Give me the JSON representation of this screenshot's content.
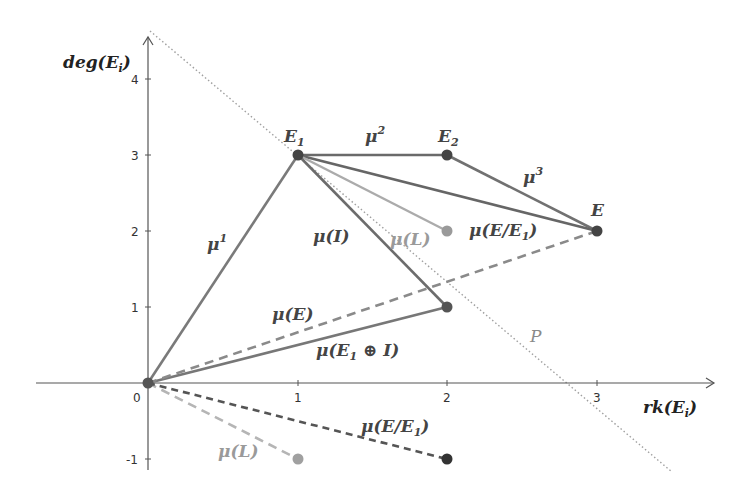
{
  "figure": {
    "type": "slope-diagram",
    "axes": {
      "x_label": "rk(E_i)",
      "x_label_main": "rk(E",
      "x_label_sub": "i",
      "x_label_close": ")",
      "y_label_main": "deg(E",
      "y_label_sub": "i",
      "y_label_close": ")",
      "x_ticks": [
        "0",
        "1",
        "2",
        "3"
      ],
      "y_ticks": [
        "-1",
        "1",
        "2",
        "3",
        "4"
      ]
    },
    "points": [
      {
        "id": "O",
        "x": 0,
        "y": 0,
        "label": "",
        "color": "#555555"
      },
      {
        "id": "E1",
        "x": 1,
        "y": 3,
        "label_main": "E",
        "label_sub": "1",
        "color": "#444444"
      },
      {
        "id": "E2",
        "x": 2,
        "y": 3,
        "label_main": "E",
        "label_sub": "2",
        "color": "#444444"
      },
      {
        "id": "E",
        "x": 3,
        "y": 2,
        "label_main": "E",
        "label_sub": "",
        "color": "#444444"
      },
      {
        "id": "L_top",
        "x": 2,
        "y": 2,
        "color": "#9a9a9a"
      },
      {
        "id": "I_pt",
        "x": 2,
        "y": 1,
        "color": "#555555"
      },
      {
        "id": "L_bottom",
        "x": 1,
        "y": -1,
        "color": "#9a9a9a"
      },
      {
        "id": "EE1_bottom",
        "x": 2,
        "y": -1,
        "color": "#333333"
      }
    ],
    "segments": [
      {
        "from": "O",
        "to": "E1",
        "style": "solid",
        "color": "#777777",
        "label": "μ¹"
      },
      {
        "from": "E1",
        "to": "E2",
        "style": "solid",
        "color": "#666666",
        "label": "μ²"
      },
      {
        "from": "E2",
        "to": "E",
        "style": "solid",
        "color": "#6e6e6e",
        "label": "μ³"
      },
      {
        "from": "E1",
        "to": "E",
        "style": "solid",
        "color": "#666666",
        "label": "μ(E/E₁)"
      },
      {
        "from": "E1",
        "to": "L_top",
        "style": "solid",
        "color": "#aaaaaa",
        "label": "μ(L)"
      },
      {
        "from": "E1",
        "to": "I_pt",
        "style": "solid",
        "color": "#6a6a6a",
        "label": "μ(I)"
      },
      {
        "from": "O",
        "to": "I_pt",
        "style": "solid",
        "color": "#777777",
        "label": "μ(E₁ ⊕ I)"
      },
      {
        "from": "O",
        "to": "E",
        "style": "dashed",
        "color": "#888888",
        "label": "μ(E)"
      },
      {
        "from": "O",
        "to": "L_bottom",
        "style": "dashed",
        "color": "#b0b0b0",
        "label": "μ(L)"
      },
      {
        "from": "O",
        "to": "EE1_bottom",
        "style": "dashed",
        "color": "#555555",
        "label": "μ(E/E₁)"
      }
    ],
    "line_P": {
      "label": "P",
      "style": "dotted",
      "color": "#999999"
    },
    "labels": {
      "mu1": "μ",
      "mu1_sup": "1",
      "mu2": "μ",
      "mu2_sup": "2",
      "mu3": "μ",
      "mu3_sup": "3",
      "muI": "μ(I)",
      "muL_top": "μ(L)",
      "muEE1_top": "μ(E/E",
      "muEE1_top_sub": "1",
      "muEE1_top_close": ")",
      "muE": "μ(E)",
      "muE1I": "μ(E",
      "muE1I_sub": "1",
      "muE1I_close": " ⊕ I)",
      "P": "P",
      "muL_bottom": "μ(L)",
      "muEE1_bottom": "μ(E/E",
      "muEE1_bottom_sub": "1",
      "muEE1_bottom_close": ")"
    }
  }
}
